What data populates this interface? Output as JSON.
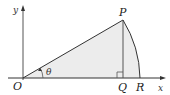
{
  "diagram": {
    "type": "geometry",
    "axes": {
      "x_label": "x",
      "y_label": "y"
    },
    "points": {
      "O": {
        "label": "O"
      },
      "P": {
        "label": "P"
      },
      "Q": {
        "label": "Q"
      },
      "R": {
        "label": "R"
      }
    },
    "angle_label": "θ",
    "colors": {
      "line": "#333333",
      "axis": "#333333",
      "shade": "#ebebeb",
      "background": "#ffffff"
    }
  }
}
